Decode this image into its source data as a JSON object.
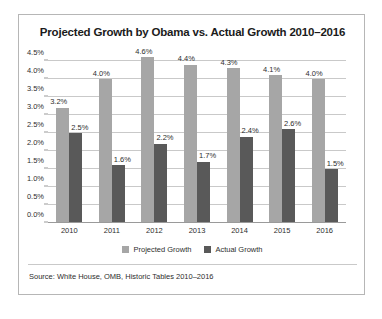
{
  "chart_data": {
    "type": "bar",
    "title": "Projected Growth by Obama vs. Actual Growth 2010–2016",
    "categories": [
      "2010",
      "2011",
      "2012",
      "2013",
      "2014",
      "2015",
      "2016"
    ],
    "series": [
      {
        "name": "Projected Growth",
        "color": "#a6a6a6",
        "values": [
          3.2,
          4.0,
          4.6,
          4.4,
          4.3,
          4.1,
          4.0
        ],
        "labels": [
          "3.2%",
          "4.0%",
          "4.6%",
          "4.4%",
          "4.3%",
          "4.1%",
          "4.0%"
        ]
      },
      {
        "name": "Actual Growth",
        "color": "#595959",
        "values": [
          2.5,
          1.6,
          2.2,
          1.7,
          2.4,
          2.6,
          1.5
        ],
        "labels": [
          "2.5%",
          "1.6%",
          "2.2%",
          "1.7%",
          "2.4%",
          "2.6%",
          "1.5%"
        ]
      }
    ],
    "xlabel": "",
    "ylabel": "",
    "ylim": [
      0.0,
      4.5
    ],
    "yticks": [
      0.0,
      0.5,
      1.0,
      1.5,
      2.0,
      2.5,
      3.0,
      3.5,
      4.0,
      4.5
    ],
    "ytick_labels": [
      "0.0%",
      "0.5%",
      "1.0%",
      "1.5%",
      "2.0%",
      "2.5%",
      "3.0%",
      "3.5%",
      "4.0%",
      "4.5%"
    ],
    "grid": true,
    "legend_position": "bottom",
    "source_note": "Source: White House, OMB, Historic Tables 2010–2016"
  }
}
